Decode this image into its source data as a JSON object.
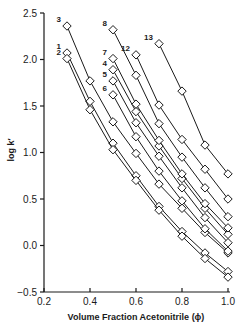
{
  "chart_data": {
    "type": "line",
    "title": "",
    "xlabel": "Volume Fraction Acetonitrile (ϕ)",
    "ylabel": "log k′",
    "xlim": [
      0.2,
      1.0
    ],
    "ylim": [
      -0.5,
      2.5
    ],
    "x_ticks": [
      0.2,
      0.4,
      0.6,
      0.8,
      1.0
    ],
    "x_tick_labels": [
      "0.2",
      "0.4",
      "0.6",
      "0.8",
      "1.0"
    ],
    "y_ticks": [
      -0.5,
      0.0,
      0.5,
      1.0,
      1.5,
      2.0,
      2.5
    ],
    "y_tick_labels": [
      "−0.5",
      "0.0",
      "0.5",
      "1.0",
      "1.5",
      "2.0",
      "2.5"
    ],
    "grid": false,
    "legend": "none (series labelled inline by number)",
    "marker": "open diamond",
    "series": [
      {
        "name": "1",
        "x": [
          0.3,
          0.4,
          0.5,
          0.6,
          0.7,
          0.8,
          0.9,
          1.0
        ],
        "values": [
          2.07,
          1.55,
          1.1,
          0.75,
          0.42,
          0.15,
          -0.08,
          -0.28
        ]
      },
      {
        "name": "2",
        "x": [
          0.3,
          0.4,
          0.5,
          0.6,
          0.7,
          0.8,
          0.9,
          1.0
        ],
        "values": [
          2.01,
          1.46,
          1.03,
          0.7,
          0.38,
          0.1,
          -0.14,
          -0.34
        ]
      },
      {
        "name": "3",
        "x": [
          0.3,
          0.4,
          0.5,
          0.6,
          0.7,
          0.8,
          0.9,
          1.0
        ],
        "values": [
          2.36,
          1.77,
          1.33,
          0.99,
          0.66,
          0.4,
          0.14,
          -0.08
        ]
      },
      {
        "name": "4",
        "x": [
          0.5,
          0.6,
          0.7,
          0.8,
          0.9,
          1.0
        ],
        "values": [
          1.89,
          1.44,
          1.07,
          0.72,
          0.4,
          0.12
        ]
      },
      {
        "name": "5",
        "x": [
          0.5,
          0.6,
          0.7,
          0.8,
          0.9,
          1.0
        ],
        "values": [
          1.77,
          1.32,
          0.96,
          0.62,
          0.3,
          0.03
        ]
      },
      {
        "name": "6",
        "x": [
          0.5,
          0.6,
          0.7,
          0.8,
          0.9,
          1.0
        ],
        "values": [
          1.62,
          1.17,
          0.8,
          0.48,
          0.18,
          -0.06
        ]
      },
      {
        "name": "7",
        "x": [
          0.5,
          0.6,
          0.7,
          0.8,
          0.9,
          1.0
        ],
        "values": [
          2.01,
          1.52,
          1.13,
          0.77,
          0.45,
          0.19
        ]
      },
      {
        "name": "8",
        "x": [
          0.5,
          0.6,
          0.7,
          0.8,
          0.9,
          1.0
        ],
        "values": [
          2.32,
          1.83,
          1.31,
          0.95,
          0.62,
          0.31
        ]
      },
      {
        "name": "12",
        "x": [
          0.6,
          0.7,
          0.8,
          0.9,
          1.0
        ],
        "values": [
          2.05,
          1.51,
          1.14,
          0.82,
          0.5
        ]
      },
      {
        "name": "13",
        "x": [
          0.7,
          0.8,
          0.9,
          1.0
        ],
        "values": [
          2.17,
          1.66,
          1.08,
          0.77
        ]
      }
    ]
  }
}
